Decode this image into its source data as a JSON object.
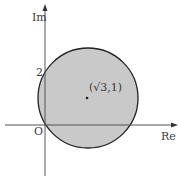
{
  "diagram": {
    "type": "complex-plane-disk",
    "axes": {
      "x_label": "Re",
      "y_label": "Im",
      "origin_label": "O"
    },
    "tick_labels": {
      "y_tick": "2"
    },
    "disk": {
      "center_label": "(√3,1)",
      "center": [
        1.732,
        1
      ],
      "radius": 2,
      "fill_color": "#c8c8c8",
      "stroke_color": "#222222"
    },
    "axis_color": "#555555"
  }
}
